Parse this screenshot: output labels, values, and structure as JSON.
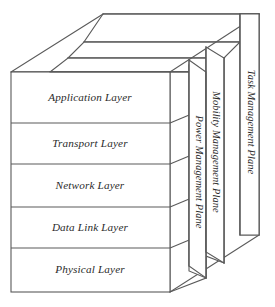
{
  "diagram": {
    "stroke_color": "#5a5a5a",
    "text_color": "#2b2b2b",
    "background_color": "#ffffff",
    "layers": [
      {
        "id": "application",
        "label": "Application Layer"
      },
      {
        "id": "transport",
        "label": "Transport Layer"
      },
      {
        "id": "network",
        "label": "Network Layer"
      },
      {
        "id": "datalink",
        "label": "Data Link Layer"
      },
      {
        "id": "physical",
        "label": "Physical Layer"
      }
    ],
    "planes": [
      {
        "id": "power",
        "label": "Power Management Plane"
      },
      {
        "id": "mobility",
        "label": "Mobility Management Plane"
      },
      {
        "id": "task",
        "label": "Task Management Plane"
      }
    ]
  }
}
